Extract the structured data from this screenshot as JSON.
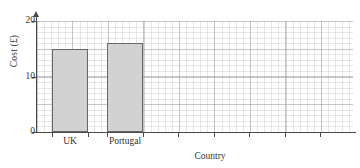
{
  "chart_data": {
    "type": "bar",
    "title": "",
    "xlabel": "Country",
    "ylabel": "Cost (£)",
    "categories": [
      "UK",
      "Portugal"
    ],
    "values": [
      15,
      16
    ],
    "ylim": [
      0,
      20
    ],
    "ytick_labels": [
      "0",
      "10",
      "20"
    ],
    "ytick_values": [
      0,
      10,
      20
    ],
    "grid": true,
    "grid_style": "graph-paper",
    "legend": "none",
    "series": [
      {
        "name": "Cost",
        "values": [
          15,
          16
        ]
      }
    ],
    "bar_fill_color": "#d2d2d2",
    "bar_border_color": "#666668",
    "axis_color": "#4a4a4a",
    "background_color": "#ffffff"
  },
  "axes": {
    "y_title": "Cost (£)",
    "x_title": "Country"
  },
  "ticks": {
    "y": [
      {
        "label": "20",
        "value": 20
      },
      {
        "label": "10",
        "value": 10
      },
      {
        "label": "0",
        "value": 0
      }
    ]
  },
  "bars": [
    {
      "label": "UK",
      "value": 15
    },
    {
      "label": "Portugal",
      "value": 16
    }
  ]
}
